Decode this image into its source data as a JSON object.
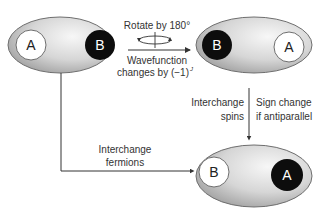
{
  "diagram": {
    "colors": {
      "ellipse_fill_light": "#f2f2f2",
      "ellipse_fill_dark": "#a8a8a8",
      "ellipse_stroke": "#6e6e6e",
      "white_particle": "#ffffff",
      "black_particle": "#0d0d0d",
      "arrow": "#333333",
      "text": "#333333"
    },
    "states": [
      {
        "id": "initial",
        "left": "A",
        "left_style": "white",
        "right": "B",
        "right_style": "black"
      },
      {
        "id": "rotated",
        "left": "B",
        "left_style": "black",
        "right": "A",
        "right_style": "white"
      },
      {
        "id": "interchanged",
        "left": "B",
        "left_style": "white",
        "right": "A",
        "right_style": "black"
      }
    ],
    "arrows": {
      "rotate": {
        "label_top": "Rotate by 180°",
        "label_bottom_line1": "Wavefunction",
        "label_bottom_line2": "changes by (−1)",
        "label_bottom_sup": "J"
      },
      "spins": {
        "label_left_line1": "Interchange",
        "label_left_line2": "spins",
        "label_right_line1": "Sign change",
        "label_right_line2": "if antiparallel"
      },
      "fermions": {
        "label_line1": "Interchange",
        "label_line2": "fermions"
      }
    }
  }
}
